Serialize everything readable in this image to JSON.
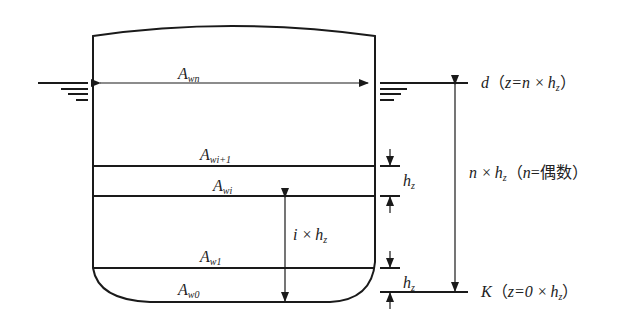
{
  "diagram": {
    "type": "ship-waterplane-layers",
    "colors": {
      "line": "#1a1a1a",
      "text": "#222222",
      "background": "#ffffff"
    },
    "areas": {
      "waterplane_n": {
        "main": "A",
        "sub": "wn"
      },
      "waterplane_i_plus_1": {
        "main": "A",
        "sub": "wi+1"
      },
      "waterplane_i": {
        "main": "A",
        "sub": "wi"
      },
      "waterplane_1": {
        "main": "A",
        "sub": "w1"
      },
      "waterplane_0": {
        "main": "A",
        "sub": "w0"
      }
    },
    "dimensions": {
      "layer_height_top": {
        "main": "h",
        "sub": "z"
      },
      "layer_height_bottom": {
        "main": "h",
        "sub": "z"
      },
      "i_times_h": {
        "prefix": "i ×",
        "main": "h",
        "sub": "z"
      },
      "n_times_h": {
        "prefix": "n ×",
        "main": "h",
        "sub": "z",
        "note_open": "（",
        "note_var": "n",
        "note_eq": "=偶数",
        "note_close": "）"
      }
    },
    "levels": {
      "draft": {
        "var": "d",
        "open": "（",
        "expr_pre": "z=n ×",
        "main": "h",
        "sub": "z",
        "close": "）"
      },
      "keel": {
        "var": "K",
        "open": "（",
        "expr_pre": "z=0 ×",
        "main": "h",
        "sub": "z",
        "close": "）"
      }
    }
  }
}
